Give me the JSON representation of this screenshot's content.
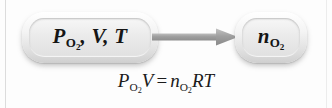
{
  "diagram": {
    "type": "flow-diagram",
    "nodes": [
      {
        "id": "inputs",
        "text": "P_O2, V, T",
        "parts": [
          {
            "base": "P",
            "sub": "O",
            "sub2": "2"
          },
          {
            "base": ", V, T",
            "sub": "",
            "sub2": ""
          }
        ],
        "x": 22,
        "y": 12,
        "width": 136,
        "height": 51
      },
      {
        "id": "output",
        "text": "n_O2",
        "parts": [
          {
            "base": "n",
            "sub": "O",
            "sub2": "2"
          }
        ],
        "x": 235,
        "y": 12,
        "width": 72,
        "height": 51
      }
    ],
    "arrow": {
      "from": "inputs",
      "to": "output",
      "direction": "right",
      "color": "#9a9a9a"
    },
    "equation": {
      "text": "P_O2 V = n_O2 RT",
      "lhs_base": "P",
      "lhs_sub": "O",
      "lhs_sub2": "2",
      "lhs_tail": "V",
      "operator": "=",
      "rhs_base": "n",
      "rhs_sub": "O",
      "rhs_sub2": "2",
      "rhs_tail": "RT"
    }
  },
  "colors": {
    "background": "#fdfdfd",
    "node_fill_top": "#ffffff",
    "node_fill_bottom": "#cfcfcf",
    "node_inner": "#ebebeb",
    "arrow": "#9a9a9a",
    "text": "#151515",
    "rule": "#dcdcdc"
  }
}
